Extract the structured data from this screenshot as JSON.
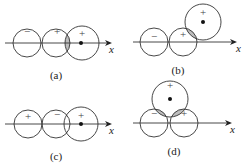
{
  "panels": [
    {
      "id": "a",
      "label": "(a)",
      "signs": [
        "−",
        "+",
        "+"
      ],
      "axis_label": "x",
      "shaded_overlap": true
    },
    {
      "id": "b",
      "label": "(b)",
      "signs": [
        "−",
        "+",
        "+"
      ],
      "axis_label": "x",
      "shaded_overlap": true
    },
    {
      "id": "c",
      "label": "(c)",
      "signs": [
        "+",
        "−",
        "+"
      ],
      "axis_label": "x",
      "shaded_overlap": false
    },
    {
      "id": "d",
      "label": "(d)",
      "signs": [
        "+",
        "−",
        "+"
      ],
      "axis_label": "x",
      "shaded_overlap": true
    }
  ],
  "colors": {
    "stroke": "#333333",
    "shade": "#bdbdbd"
  }
}
